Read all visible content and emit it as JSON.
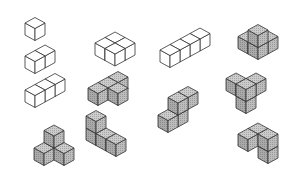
{
  "style": {
    "stroke": "#333333",
    "white_fill": {
      "top": "#ffffff",
      "left": "#ffffff",
      "right": "#ffffff"
    },
    "gray_fill": {
      "top": "#c4c4c4",
      "left": "#a9a9a9",
      "right": "#b6b6b6"
    },
    "unit": {
      "dx": 10,
      "dy": 5.5,
      "h": 12
    }
  },
  "shapes": [
    {
      "name": "monocube",
      "fill": "white",
      "origin": [
        25,
        35
      ],
      "cubes": [
        [
          0,
          0,
          0
        ]
      ]
    },
    {
      "name": "dicube",
      "fill": "white",
      "origin": [
        25,
        68
      ],
      "cubes": [
        [
          0,
          0,
          0
        ],
        [
          1,
          0,
          0
        ]
      ]
    },
    {
      "name": "tricube-line",
      "fill": "white",
      "origin": [
        25,
        102
      ],
      "cubes": [
        [
          0,
          0,
          0
        ],
        [
          1,
          0,
          0
        ],
        [
          2,
          0,
          0
        ]
      ]
    },
    {
      "name": "tetracube-stair",
      "fill": "gray",
      "origin": [
        34,
        160
      ],
      "cubes": [
        [
          0,
          0,
          0
        ],
        [
          1,
          0,
          0
        ],
        [
          1,
          0,
          1
        ],
        [
          1,
          1,
          0
        ]
      ]
    },
    {
      "name": "tetracube-square",
      "fill": "white",
      "origin": [
        95,
        55
      ],
      "cubes": [
        [
          0,
          0,
          0
        ],
        [
          1,
          0,
          0
        ],
        [
          0,
          1,
          0
        ],
        [
          1,
          1,
          0
        ]
      ]
    },
    {
      "name": "tetracube-L-flat",
      "fill": "gray",
      "origin": [
        88,
        100
      ],
      "cubes": [
        [
          0,
          0,
          0
        ],
        [
          1,
          0,
          0
        ],
        [
          2,
          0,
          0
        ],
        [
          1,
          1,
          0
        ]
      ]
    },
    {
      "name": "tetracube-L-standing",
      "fill": "gray",
      "origin": [
        86,
        140
      ],
      "cubes": [
        [
          0,
          0,
          0
        ],
        [
          0,
          0,
          1
        ],
        [
          0,
          1,
          0
        ],
        [
          0,
          2,
          0
        ]
      ]
    },
    {
      "name": "tetracube-line",
      "fill": "white",
      "origin": [
        160,
        62
      ],
      "cubes": [
        [
          0,
          0,
          0
        ],
        [
          1,
          0,
          0
        ],
        [
          2,
          0,
          0
        ],
        [
          3,
          0,
          0
        ]
      ]
    },
    {
      "name": "tetracube-S",
      "fill": "gray",
      "origin": [
        158,
        127
      ],
      "cubes": [
        [
          0,
          0,
          0
        ],
        [
          1,
          0,
          0
        ],
        [
          1,
          0,
          1
        ],
        [
          2,
          0,
          1
        ]
      ]
    },
    {
      "name": "tetracube-tripod",
      "fill": "gray",
      "origin": [
        248,
        54
      ],
      "cubes": [
        [
          0,
          -1,
          0
        ],
        [
          1,
          0,
          0
        ],
        [
          0,
          0,
          0
        ],
        [
          0,
          0,
          1
        ]
      ]
    },
    {
      "name": "tetracube-screw-left",
      "fill": "gray",
      "origin": [
        236,
        108
      ],
      "cubes": [
        [
          0,
          0,
          0
        ],
        [
          0,
          0,
          1
        ],
        [
          1,
          0,
          1
        ],
        [
          0,
          -1,
          1
        ]
      ]
    },
    {
      "name": "tetracube-screw-right",
      "fill": "gray",
      "origin": [
        258,
        158
      ],
      "cubes": [
        [
          0,
          0,
          0
        ],
        [
          0,
          0,
          1
        ],
        [
          0,
          -1,
          1
        ],
        [
          -1,
          -1,
          1
        ]
      ]
    }
  ]
}
